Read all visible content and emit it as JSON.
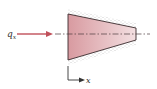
{
  "diagram": {
    "heat_flux_label": "q",
    "heat_flux_subscript": "x",
    "axis_label": "x",
    "colors": {
      "arrow": "#c0505a",
      "body_fill_left": "#d89aa0",
      "body_fill_right": "#f3dfe1",
      "outline": "#3a2a2c",
      "centerline": "#4a3a3c",
      "insulation_dots": "#9a9a9a",
      "axis": "#333333"
    }
  }
}
